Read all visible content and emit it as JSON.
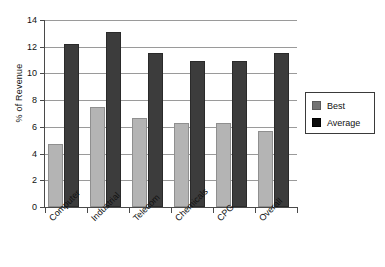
{
  "chart_data": {
    "type": "bar",
    "title": "",
    "xlabel": "",
    "ylabel": "% of Revenue",
    "categories": [
      "Computer",
      "Industrial",
      "Telecom",
      "Chemicals",
      "CPG",
      "Overall"
    ],
    "series": [
      {
        "name": "Best",
        "color": "#b4b4b4",
        "values": [
          4.7,
          7.5,
          6.7,
          6.3,
          6.3,
          5.7
        ]
      },
      {
        "name": "Average",
        "color": "#3c3c3c",
        "values": [
          12.2,
          13.1,
          11.5,
          10.9,
          10.9,
          11.5
        ]
      }
    ],
    "ylim": [
      0,
      14
    ],
    "yticks": [
      0,
      2,
      4,
      6,
      8,
      10,
      12,
      14
    ],
    "ytick_labels": [
      "0",
      "2",
      "4",
      "6",
      "8",
      "10",
      "12",
      "14"
    ],
    "grid": true,
    "grid_axis": "y",
    "legend_position": "right"
  },
  "legend": {
    "entries": [
      {
        "label": "Best"
      },
      {
        "label": "Average"
      }
    ]
  },
  "axis": {
    "y_title": "% of Revenue"
  }
}
